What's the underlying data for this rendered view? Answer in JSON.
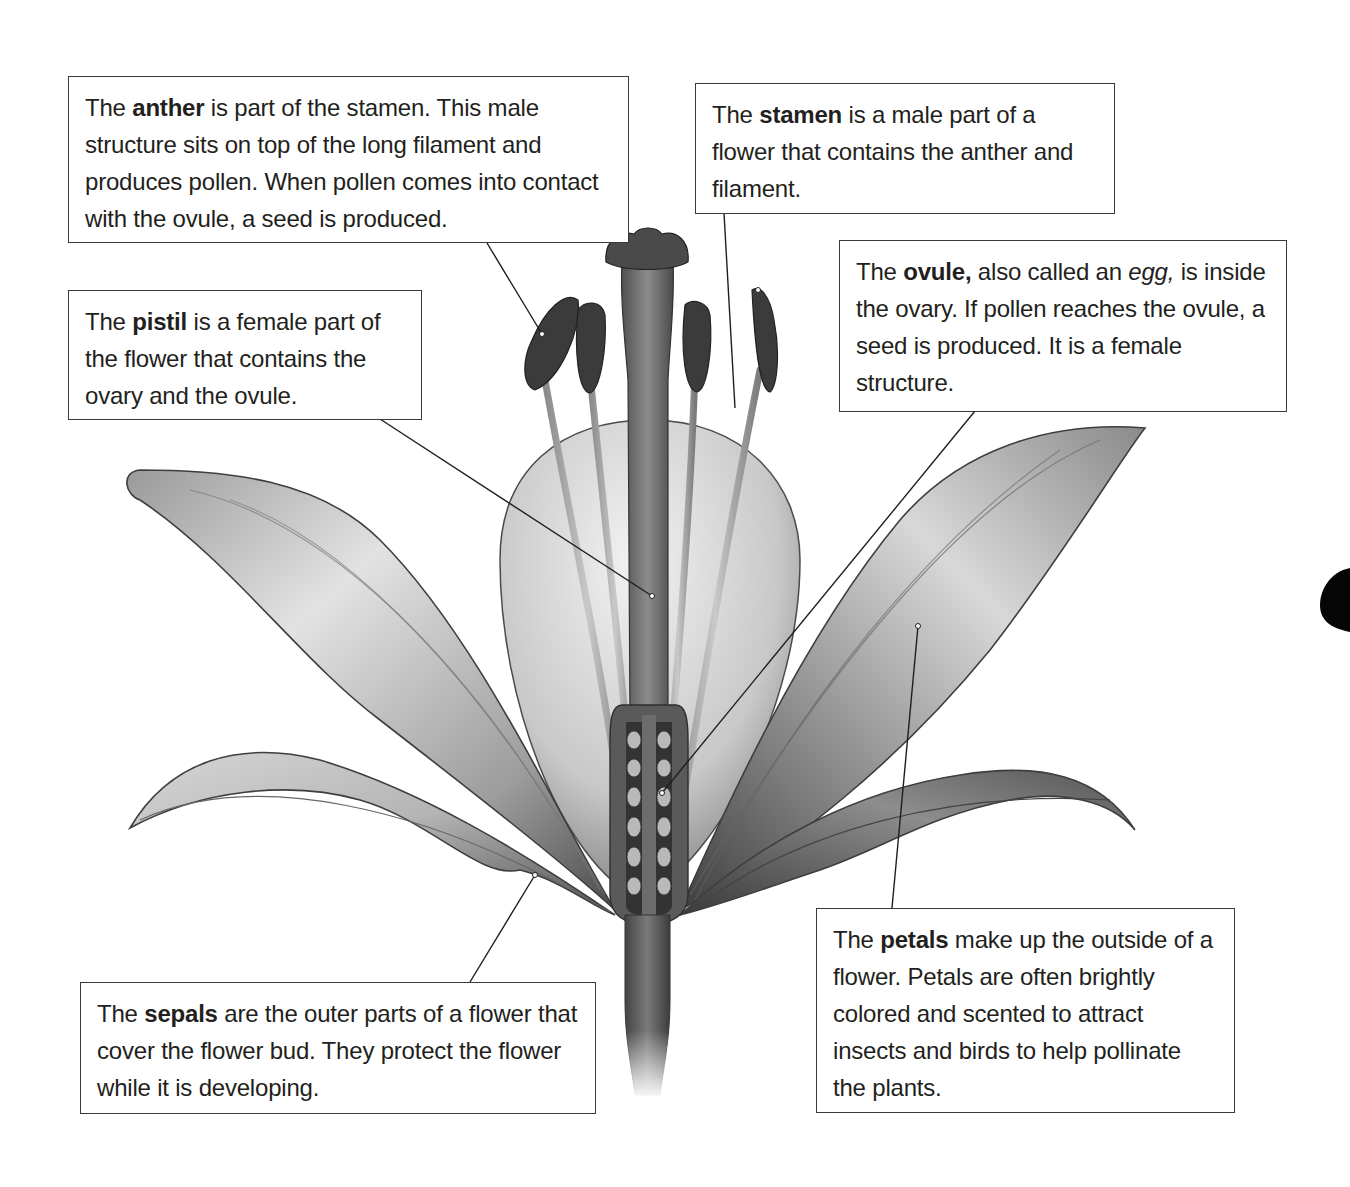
{
  "diagram": {
    "colors": {
      "ink": "#231f20",
      "border": "#3a3a3a",
      "background": "#ffffff",
      "anther": "#3b3b3b"
    }
  },
  "callouts": {
    "anther": {
      "pre": "The ",
      "term": "anther",
      "post": " is part of the stamen. This male structure sits on top of the long filament and produces pollen. When pollen comes into contact with the ovule, a seed is produced."
    },
    "stamen": {
      "pre": "The ",
      "term": "stamen",
      "post": " is a male part of a flower that contains the anther and filament."
    },
    "pistil": {
      "pre": "The ",
      "term": "pistil",
      "post": " is a female part of the flower that contains the ovary and the ovule."
    },
    "ovule": {
      "pre": "The ",
      "term": "ovule,",
      "mid": " also called an ",
      "italic": "egg,",
      "post": " is inside the ovary. If pollen reaches the ovule, a seed is produced. It is a female structure."
    },
    "sepals": {
      "pre": "The ",
      "term": "sepals",
      "post": " are the outer parts of a flower that cover the flower bud. They protect the flower while it is developing."
    },
    "petals": {
      "pre": "The ",
      "term": "petals",
      "post": " make up the outside of a flower. Petals are often brightly colored and scented to attract insects and birds to help pollinate the plants."
    }
  },
  "labels": [
    "anther",
    "stamen",
    "pistil",
    "ovule",
    "sepals",
    "petals"
  ]
}
